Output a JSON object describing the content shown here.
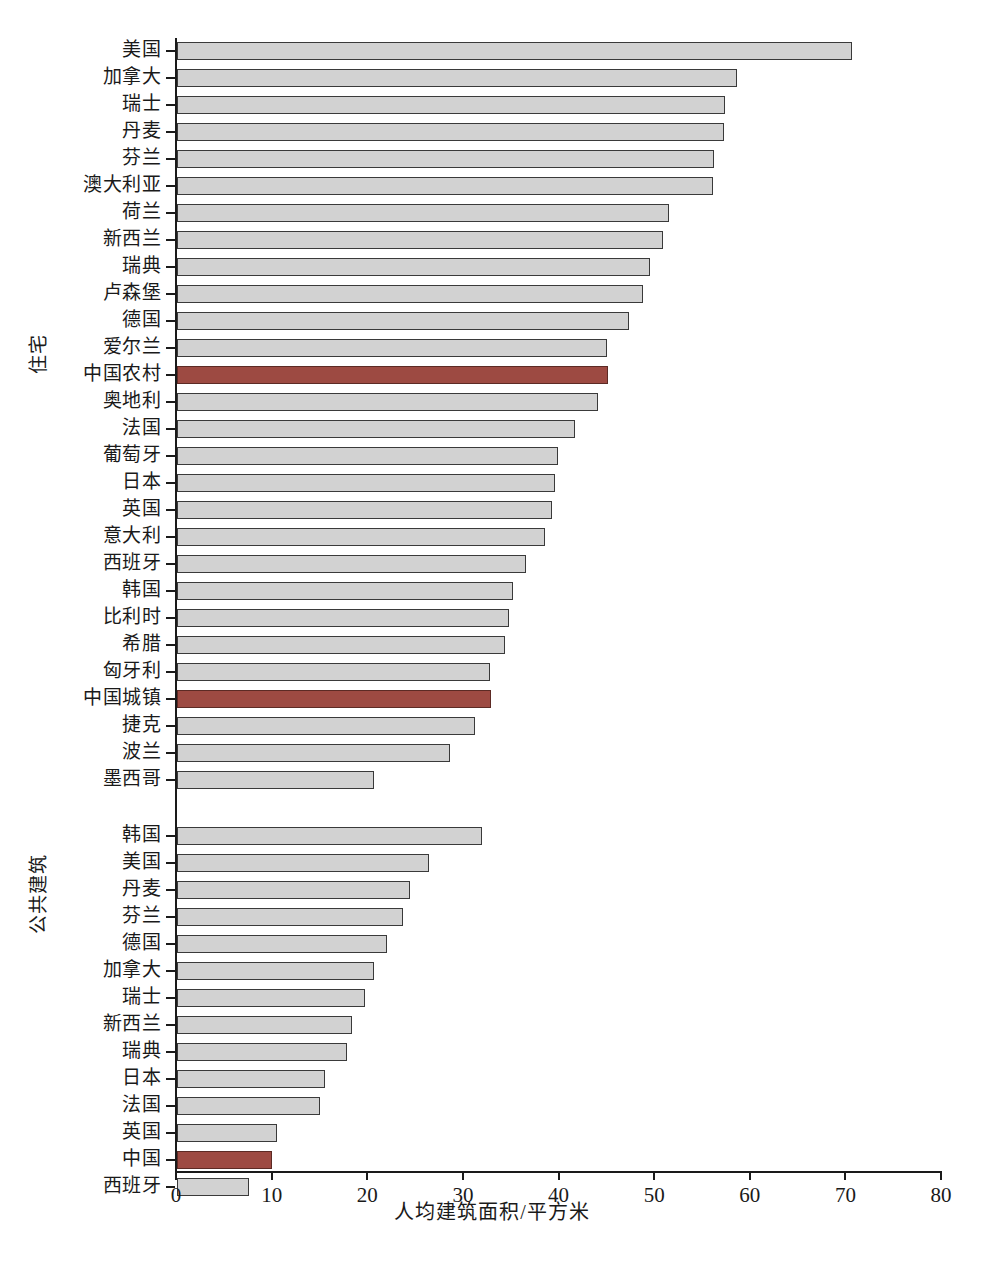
{
  "chart_data": {
    "type": "bar",
    "orientation": "horizontal",
    "title": "",
    "xlabel": "人均建筑面积/平方米",
    "ylabel": "",
    "xlim": [
      0,
      80
    ],
    "xticks": [
      0,
      10,
      20,
      30,
      40,
      50,
      60,
      70,
      80
    ],
    "grid": false,
    "legend": null,
    "highlight_color": "#9d4a42",
    "bar_color": "#d2d2d2",
    "bar_edge_color": "#3a3a3a",
    "groups": [
      {
        "name": "住宅",
        "categories": [
          "美国",
          "加拿大",
          "瑞士",
          "丹麦",
          "芬兰",
          "澳大利亚",
          "荷兰",
          "新西兰",
          "瑞典",
          "卢森堡",
          "德国",
          "爱尔兰",
          "中国农村",
          "奥地利",
          "法国",
          "葡萄牙",
          "日本",
          "英国",
          "意大利",
          "西班牙",
          "韩国",
          "比利时",
          "希腊",
          "匈牙利",
          "中国城镇",
          "捷克",
          "波兰",
          "墨西哥"
        ],
        "values": [
          70.6,
          58.6,
          57.3,
          57.2,
          56.2,
          56.1,
          51.4,
          50.8,
          49.5,
          48.7,
          47.3,
          45.0,
          45.1,
          44.0,
          41.6,
          39.8,
          39.5,
          39.2,
          38.5,
          36.5,
          35.1,
          34.7,
          34.3,
          32.7,
          32.8,
          31.2,
          28.6,
          20.6
        ],
        "highlighted": [
          "中国农村",
          "中国城镇"
        ]
      },
      {
        "name": "公共建筑",
        "categories": [
          "韩国",
          "美国",
          "丹麦",
          "芬兰",
          "德国",
          "加拿大",
          "瑞士",
          "新西兰",
          "瑞典",
          "日本",
          "法国",
          "英国",
          "中国",
          "西班牙"
        ],
        "values": [
          31.9,
          26.4,
          24.4,
          23.6,
          22.0,
          20.6,
          19.7,
          18.3,
          17.8,
          15.5,
          15.0,
          10.5,
          9.9,
          7.5
        ],
        "highlighted": [
          "中国"
        ]
      }
    ]
  },
  "caption": ""
}
